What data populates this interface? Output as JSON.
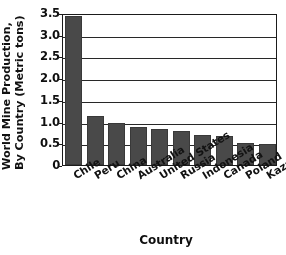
{
  "chart_data": {
    "type": "bar",
    "title": "",
    "xlabel": "Country",
    "ylabel": "World Mine Production, By Country (Metric tons)",
    "ylabel_lines": [
      "World Mine Production,",
      "By Country (Metric tons)"
    ],
    "categories": [
      "Chile",
      "Peru",
      "China",
      "Australia",
      "United States",
      "Russia",
      "Indonesia",
      "Canada",
      "Poland",
      "Kazakhstan"
    ],
    "values": [
      3.42,
      1.12,
      0.97,
      0.87,
      0.84,
      0.79,
      0.68,
      0.66,
      0.5,
      0.49
    ],
    "ylim": [
      0,
      3.5
    ],
    "ytick_labels": [
      "0",
      "0.5",
      "1.0",
      "1.5",
      "2.0",
      "2.5",
      "3.0",
      "3.5"
    ],
    "ytick_values": [
      0,
      0.5,
      1.0,
      1.5,
      2.0,
      2.5,
      3.0,
      3.5
    ],
    "grid": true,
    "grid_axis": "y",
    "legend": "none",
    "bar_color": "#4a4a4a",
    "axis_color": "#1d1d1d",
    "background": "#ffffff"
  }
}
